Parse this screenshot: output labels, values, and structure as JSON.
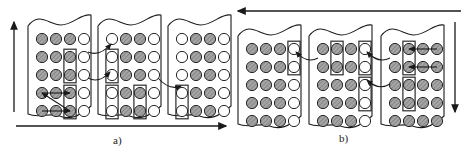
{
  "figure": {
    "type": "process-diagram",
    "labels": [
      {
        "id": "label-a",
        "text": "a)",
        "x": 113,
        "y": 134
      },
      {
        "id": "label-b",
        "text": "b)",
        "x": 339,
        "y": 132
      }
    ],
    "colors": {
      "stroke": "#1a1a1a",
      "filled_circle_fill": "#9a9a9a",
      "filled_circle_hatch": "#6e6e6e",
      "empty_circle_fill": "#ffffff",
      "box_stroke": "#2b2b2b",
      "background": "#ffffff"
    },
    "legend": {
      "filled": "occupied site",
      "empty": "vacant site"
    }
  },
  "stage_a": {
    "name": "a",
    "axis_arrows": [
      {
        "id": "arrow-up-left",
        "direction": "up",
        "x1": 14,
        "y1": 112,
        "x2": 14,
        "y2": 22
      },
      {
        "id": "arrow-right-bottom",
        "direction": "right",
        "x1": 16,
        "y1": 126,
        "x2": 226,
        "y2": 126
      }
    ],
    "panels": [
      {
        "id": "panel-a1",
        "x": 28,
        "y": 12,
        "w": 63,
        "h": 106,
        "cols": 4,
        "rows": 5,
        "grid": [
          [
            1,
            1,
            1,
            0
          ],
          [
            1,
            1,
            1,
            0
          ],
          [
            1,
            1,
            1,
            0
          ],
          [
            1,
            1,
            1,
            0
          ],
          [
            1,
            1,
            1,
            0
          ]
        ],
        "boxes": [
          {
            "col": 3,
            "row_start": 2,
            "row_end": 3
          },
          {
            "col": 3,
            "row_start": 4,
            "row_end": 5
          }
        ],
        "internal_arrows": [
          {
            "from_col": 3,
            "from_row": 5,
            "to_col": 1,
            "to_row": 4,
            "style": "left"
          },
          {
            "from_col": 1,
            "from_row": 4,
            "to_col": 3,
            "to_row": 4,
            "style": "right"
          },
          {
            "from_col": 1,
            "from_row": 5,
            "to_col": 3,
            "to_row": 5,
            "style": "right"
          }
        ]
      },
      {
        "id": "panel-a2",
        "x": 98,
        "y": 12,
        "w": 63,
        "h": 106,
        "cols": 4,
        "rows": 5,
        "grid": [
          [
            0,
            1,
            1,
            0
          ],
          [
            0,
            1,
            1,
            0
          ],
          [
            0,
            1,
            1,
            0
          ],
          [
            0,
            1,
            1,
            0
          ],
          [
            0,
            1,
            1,
            0
          ]
        ],
        "boxes": [
          {
            "col": 1,
            "row_start": 2,
            "row_end": 3
          },
          {
            "col": 1,
            "row_start": 4,
            "row_end": 5
          },
          {
            "col": 3,
            "row_start": 4,
            "row_end": 5
          }
        ],
        "internal_arrows": []
      },
      {
        "id": "panel-a3",
        "x": 168,
        "y": 12,
        "w": 63,
        "h": 106,
        "cols": 4,
        "rows": 5,
        "grid": [
          [
            0,
            1,
            1,
            0
          ],
          [
            0,
            1,
            1,
            0
          ],
          [
            0,
            1,
            1,
            0
          ],
          [
            0,
            1,
            1,
            0
          ],
          [
            0,
            1,
            1,
            0
          ]
        ],
        "boxes": [
          {
            "col": 1,
            "row_start": 4,
            "row_end": 5
          }
        ],
        "internal_arrows": []
      }
    ],
    "transfer_arrows": [
      {
        "id": "transfer-a1-a2-top",
        "from": "panel-a1",
        "to": "panel-a2",
        "direction": "right"
      },
      {
        "id": "transfer-a1-a2-bottom",
        "from": "panel-a1",
        "to": "panel-a2",
        "direction": "right"
      },
      {
        "id": "transfer-a2-a3",
        "from": "panel-a2",
        "to": "panel-a3",
        "direction": "right"
      }
    ]
  },
  "stage_b": {
    "name": "b",
    "axis_arrows": [
      {
        "id": "arrow-left-top",
        "direction": "left",
        "x1": 461,
        "y1": 11,
        "x2": 238,
        "y2": 11
      },
      {
        "id": "arrow-down-right",
        "direction": "down",
        "x1": 455,
        "y1": 22,
        "x2": 455,
        "y2": 112
      }
    ],
    "panels": [
      {
        "id": "panel-b1",
        "x": 238,
        "y": 22,
        "w": 63,
        "h": 106,
        "cols": 4,
        "rows": 5,
        "grid": [
          [
            1,
            1,
            1,
            0
          ],
          [
            1,
            1,
            1,
            0
          ],
          [
            1,
            1,
            1,
            0
          ],
          [
            1,
            1,
            1,
            0
          ],
          [
            1,
            1,
            1,
            0
          ]
        ],
        "boxes": [
          {
            "col": 4,
            "row_start": 1,
            "row_end": 2
          }
        ],
        "internal_arrows": []
      },
      {
        "id": "panel-b2",
        "x": 309,
        "y": 22,
        "w": 63,
        "h": 106,
        "cols": 4,
        "rows": 5,
        "grid": [
          [
            1,
            1,
            1,
            0
          ],
          [
            1,
            1,
            1,
            0
          ],
          [
            1,
            1,
            1,
            0
          ],
          [
            1,
            1,
            1,
            0
          ],
          [
            1,
            1,
            1,
            0
          ]
        ],
        "boxes": [
          {
            "col": 2,
            "row_start": 1,
            "row_end": 2
          },
          {
            "col": 4,
            "row_start": 1,
            "row_end": 2
          },
          {
            "col": 4,
            "row_start": 3,
            "row_end": 4
          }
        ],
        "internal_arrows": []
      },
      {
        "id": "panel-b3",
        "x": 381,
        "y": 22,
        "w": 63,
        "h": 106,
        "cols": 4,
        "rows": 5,
        "grid": [
          [
            1,
            1,
            1,
            1
          ],
          [
            1,
            1,
            1,
            1
          ],
          [
            1,
            1,
            1,
            1
          ],
          [
            1,
            1,
            1,
            1
          ],
          [
            1,
            1,
            1,
            1
          ]
        ],
        "boxes": [
          {
            "col": 2,
            "row_start": 1,
            "row_end": 2
          },
          {
            "col": 2,
            "row_start": 3,
            "row_end": 4
          }
        ],
        "internal_arrows": [
          {
            "from_col": 4,
            "from_row": 1,
            "to_col": 2,
            "to_row": 1,
            "style": "left"
          },
          {
            "from_col": 4,
            "from_row": 2,
            "to_col": 2,
            "to_row": 2,
            "style": "left"
          }
        ]
      }
    ],
    "transfer_arrows": [
      {
        "id": "transfer-b2-b1",
        "from": "panel-b2",
        "to": "panel-b1",
        "direction": "left"
      },
      {
        "id": "transfer-b3-b2-top",
        "from": "panel-b3",
        "to": "panel-b2",
        "direction": "left"
      },
      {
        "id": "transfer-b3-b2-bottom",
        "from": "panel-b3",
        "to": "panel-b2",
        "direction": "left"
      }
    ]
  }
}
